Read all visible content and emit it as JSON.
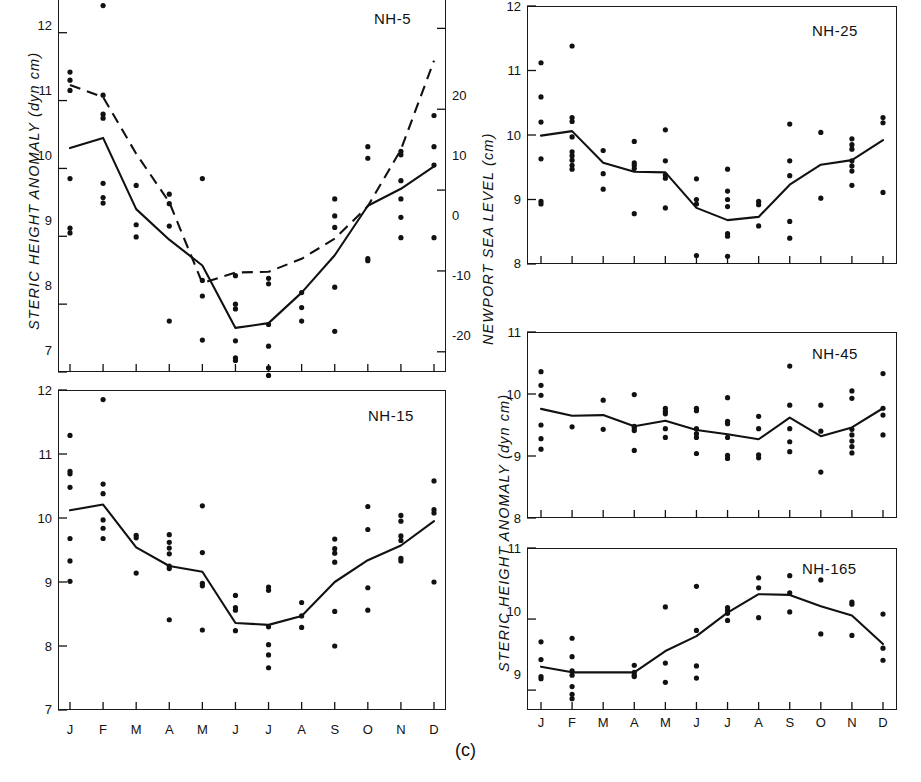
{
  "figure": {
    "caption": "(c)",
    "left_axis_label": "STERIC  HEIGHT  ANOMALY  (dyn cm)",
    "right_axis_label": "NEWPORT  SEA  LEVEL  (cm)",
    "months": [
      "J",
      "F",
      "M",
      "A",
      "M",
      "J",
      "J",
      "A",
      "S",
      "O",
      "N",
      "D"
    ]
  },
  "chart_data": [
    {
      "type": "scatter",
      "title": "NH-5",
      "xlabel": "",
      "ylabel": "STERIC HEIGHT ANOMALY (dyn cm)",
      "y2label": "NEWPORT SEA LEVEL (cm)",
      "categories": [
        "J",
        "F",
        "M",
        "A",
        "M",
        "J",
        "J",
        "A",
        "S",
        "O",
        "N",
        "D"
      ],
      "ylim": [
        7,
        12.6
      ],
      "yticks": [
        7,
        8,
        9,
        10,
        11,
        12
      ],
      "y2lim": [
        -22.5,
        24.5
      ],
      "y2ticks": [
        -20,
        -10,
        0,
        10,
        20
      ],
      "grid": false,
      "legend": "none",
      "series": [
        {
          "name": "Mean steric height",
          "style": "solid",
          "values": [
            10.3,
            10.45,
            9.4,
            8.95,
            8.57,
            7.65,
            7.72,
            8.17,
            8.72,
            9.45,
            9.7,
            10.03
          ]
        },
        {
          "name": "Newport sea level (mean, right axis)",
          "style": "dashed",
          "units": "cm",
          "values": [
            13.0,
            11.5,
            4.5,
            -1.5,
            -11.5,
            -10.2,
            -10.1,
            -8.5,
            -6.0,
            -2.0,
            5.0,
            16.0
          ]
        }
      ],
      "scatter": {
        "J": [
          11.42,
          11.3,
          11.15,
          9.85,
          9.12,
          9.05
        ],
        "F": [
          12.4,
          11.08,
          10.8,
          10.74,
          9.78,
          9.57,
          9.49
        ],
        "M": [
          9.75,
          9.17,
          8.99
        ],
        "A": [
          9.62,
          9.48,
          9.15,
          7.75
        ],
        "M2": [
          9.85,
          8.35,
          8.12,
          7.47
        ],
        "J2": [
          8.42,
          8.0,
          7.93,
          7.46,
          7.21,
          7.17
        ],
        "J3": [
          8.38,
          8.3,
          7.7,
          7.38,
          7.06,
          6.95
        ],
        "A2": [
          8.17,
          7.95,
          7.75
        ],
        "S": [
          9.55,
          9.3,
          9.13,
          8.25,
          7.6
        ],
        "O": [
          10.32,
          10.15,
          8.67,
          8.64
        ],
        "N": [
          10.25,
          10.2,
          9.82,
          9.55,
          9.28,
          8.98
        ],
        "D": [
          10.78,
          10.32,
          10.05,
          8.98
        ]
      }
    },
    {
      "type": "scatter",
      "title": "NH-15",
      "xlabel": "",
      "ylabel": "STERIC HEIGHT ANOMALY (dyn cm)",
      "categories": [
        "J",
        "F",
        "M",
        "A",
        "M",
        "J",
        "J",
        "A",
        "S",
        "O",
        "N",
        "D"
      ],
      "ylim": [
        7,
        12
      ],
      "yticks": [
        7,
        8,
        9,
        10,
        11,
        12
      ],
      "grid": false,
      "legend": "none",
      "series": [
        {
          "name": "Mean steric height",
          "style": "solid",
          "values": [
            10.12,
            10.21,
            9.54,
            9.25,
            9.16,
            8.36,
            8.33,
            8.47,
            9.0,
            9.34,
            9.57,
            9.95
          ]
        }
      ],
      "scatter": {
        "J": [
          11.29,
          10.73,
          10.69,
          10.48,
          9.68,
          9.33,
          9.01
        ],
        "F": [
          11.85,
          10.53,
          10.38,
          9.97,
          9.84,
          9.68
        ],
        "M": [
          9.73,
          9.69,
          9.14
        ],
        "A": [
          9.74,
          9.62,
          9.53,
          9.44,
          9.25,
          9.21,
          8.41
        ],
        "M2": [
          10.19,
          9.46,
          8.98,
          8.94,
          8.25
        ],
        "J2": [
          8.79,
          8.6,
          8.56,
          8.24
        ],
        "J3": [
          8.92,
          8.87,
          8.3,
          8.02,
          7.86,
          7.66
        ],
        "A2": [
          8.68,
          8.47,
          8.29
        ],
        "S": [
          9.67,
          9.52,
          9.45,
          9.31,
          8.54,
          8.0
        ],
        "O": [
          10.18,
          9.82,
          8.91,
          8.56
        ],
        "N": [
          10.04,
          9.95,
          9.72,
          9.65,
          9.37,
          9.33
        ],
        "D": [
          10.58,
          10.13,
          10.08,
          9.0
        ]
      }
    },
    {
      "type": "scatter",
      "title": "NH-25",
      "xlabel": "",
      "ylabel": "STERIC HEIGHT ANOMALY (dyn cm)",
      "categories": [
        "J",
        "F",
        "M",
        "A",
        "M",
        "J",
        "J",
        "A",
        "S",
        "O",
        "N",
        "D"
      ],
      "ylim": [
        8,
        12
      ],
      "yticks": [
        8,
        9,
        10,
        11,
        12
      ],
      "grid": false,
      "legend": "none",
      "series": [
        {
          "name": "Mean steric height",
          "style": "solid",
          "values": [
            9.99,
            10.06,
            9.57,
            9.43,
            9.42,
            8.87,
            8.68,
            8.73,
            9.23,
            9.54,
            9.61,
            9.92
          ]
        }
      ],
      "scatter": {
        "J": [
          11.12,
          10.59,
          10.2,
          9.63,
          8.97,
          8.93
        ],
        "F": [
          11.38,
          10.27,
          10.21,
          9.97,
          9.74,
          9.68,
          9.61,
          9.53,
          9.47
        ],
        "M": [
          9.76,
          9.4,
          9.16
        ],
        "A": [
          9.9,
          9.57,
          9.53,
          9.48,
          8.78
        ],
        "M2": [
          10.08,
          9.6,
          9.38,
          9.33,
          8.87
        ],
        "J2": [
          9.32,
          9.0,
          8.93,
          8.13
        ],
        "J3": [
          9.47,
          9.13,
          9.0,
          8.89,
          8.47,
          8.43,
          8.12
        ],
        "A2": [
          8.97,
          8.92,
          8.59
        ],
        "S": [
          10.17,
          9.6,
          9.37,
          8.66,
          8.4
        ],
        "O": [
          10.04,
          9.02
        ],
        "N": [
          9.94,
          9.85,
          9.78,
          9.6,
          9.52,
          9.44,
          9.22
        ],
        "D": [
          10.27,
          10.19,
          9.11
        ]
      }
    },
    {
      "type": "scatter",
      "title": "NH-45",
      "xlabel": "",
      "ylabel": "STERIC HEIGHT ANOMALY (dyn cm)",
      "categories": [
        "J",
        "F",
        "M",
        "A",
        "M",
        "J",
        "J",
        "A",
        "S",
        "O",
        "N",
        "D"
      ],
      "ylim": [
        8,
        11
      ],
      "yticks": [
        8,
        9,
        10,
        11
      ],
      "grid": false,
      "legend": "none",
      "series": [
        {
          "name": "Mean steric height",
          "style": "solid",
          "values": [
            9.76,
            9.65,
            9.66,
            9.48,
            9.57,
            9.42,
            9.35,
            9.27,
            9.62,
            9.32,
            9.46,
            9.77
          ]
        }
      ],
      "scatter": {
        "J": [
          10.36,
          10.14,
          9.98,
          9.5,
          9.28,
          9.11
        ],
        "F": [
          9.47
        ],
        "M": [
          9.9,
          9.43
        ],
        "A": [
          9.99,
          9.48,
          9.45,
          9.41,
          9.09
        ],
        "M2": [
          9.77,
          9.72,
          9.68,
          9.44,
          9.3
        ],
        "J2": [
          9.77,
          9.73,
          9.44,
          9.36,
          9.3,
          9.04
        ],
        "J3": [
          9.94,
          9.56,
          9.52,
          9.3,
          9.01,
          8.96
        ],
        "A2": [
          9.64,
          9.44,
          9.02,
          8.97
        ],
        "S": [
          10.45,
          9.82,
          9.44,
          9.23,
          9.07
        ],
        "O": [
          9.82,
          9.4,
          8.74
        ],
        "N": [
          10.05,
          9.93,
          9.43,
          9.34,
          9.24,
          9.15,
          9.05
        ],
        "D": [
          10.33,
          9.77,
          9.66,
          9.34
        ]
      }
    },
    {
      "type": "scatter",
      "title": "NH-165",
      "xlabel": "",
      "ylabel": "STERIC HEIGHT ANOMALY (dyn cm)",
      "categories": [
        "J",
        "F",
        "M",
        "A",
        "M",
        "J",
        "J",
        "A",
        "S",
        "O",
        "N",
        "D"
      ],
      "ylim": [
        8.72,
        11
      ],
      "yticks": [
        9,
        10,
        11
      ],
      "grid": false,
      "legend": "none",
      "series": [
        {
          "name": "Mean steric height",
          "style": "solid",
          "values": [
            9.33,
            9.25,
            9.25,
            9.25,
            9.55,
            9.76,
            10.09,
            10.35,
            10.34,
            10.18,
            10.05,
            9.65
          ]
        }
      ],
      "scatter": {
        "J": [
          9.68,
          9.43,
          9.19,
          9.16
        ],
        "F": [
          9.73,
          9.47,
          9.27,
          9.21,
          9.05,
          8.94,
          8.88
        ],
        "M": [],
        "A": [
          9.35,
          9.25,
          9.21,
          9.19
        ],
        "M2": [
          10.17,
          9.38,
          9.11
        ],
        "J2": [
          10.46,
          9.84,
          9.34,
          9.17
        ],
        "J3": [
          10.16,
          10.12,
          10.08,
          9.98
        ],
        "A2": [
          10.58,
          10.44,
          10.02
        ],
        "S": [
          10.61,
          10.37,
          10.1
        ],
        "O": [
          10.55,
          9.79
        ],
        "N": [
          10.24,
          10.21,
          9.77
        ],
        "D": [
          10.07,
          9.59,
          9.42
        ]
      }
    }
  ]
}
